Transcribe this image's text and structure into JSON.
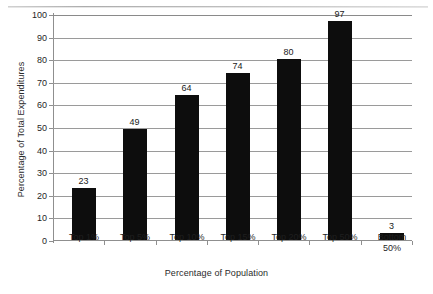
{
  "chart_data": {
    "type": "bar",
    "title": "",
    "xlabel": "Percentage of Population",
    "ylabel": "Percentage of Total Expenditures",
    "categories": [
      "Top 1%",
      "Top 5%",
      "Top 10%",
      "Top 15%",
      "Top 20%",
      "Top 50%",
      "Bottom 50%"
    ],
    "values": [
      23,
      49,
      64,
      74,
      80,
      97,
      3
    ],
    "ylim": [
      0,
      100
    ],
    "ytick_step": 10,
    "yticks": [
      0,
      10,
      20,
      30,
      40,
      50,
      60,
      70,
      80,
      90,
      100
    ],
    "ytick_labels": [
      "0",
      "10",
      "20",
      "30",
      "40",
      "50",
      "60",
      "70",
      "80",
      "90",
      "100"
    ],
    "data_labels": [
      "23",
      "49",
      "64",
      "74",
      "80",
      "97",
      "3"
    ],
    "grid": "horizontal",
    "legend": "none",
    "bar_color": "#0d0d0d",
    "gridline_color": "#9a9a9a",
    "axis_color": "#8f8f8f",
    "background_color": "#ffffff"
  },
  "axes": {
    "y_title": "Percentage of Total Expenditures",
    "x_title": "Percentage of Population"
  }
}
